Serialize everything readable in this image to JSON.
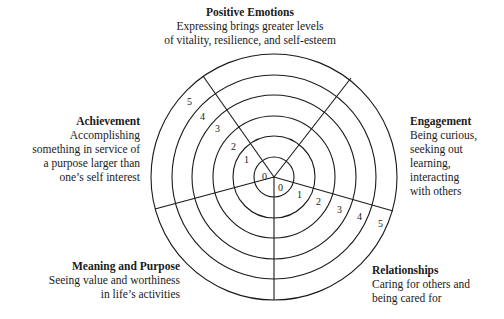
{
  "domains": [
    {
      "id": "positive-emotions",
      "title": "Positive Emotions",
      "description": "Expressing brings greater levels of vitality, resilience, and self-esteem",
      "lines": [
        "Expressing brings greater levels",
        "of vitality, resilience, and self-esteem"
      ]
    },
    {
      "id": "engagement",
      "title": "Engagement",
      "description": "Being curious, seeking out learning, interacting with others",
      "lines": [
        "Being curious,",
        "seeking out",
        "learning,",
        "interacting",
        "with others"
      ]
    },
    {
      "id": "relationships",
      "title": "Relationships",
      "description": "Caring for others and being cared for",
      "lines": [
        "Caring for others and",
        "being cared for"
      ]
    },
    {
      "id": "meaning-and-purpose",
      "title": "Meaning and Purpose",
      "description": "Seeing value and worthiness in life's activities",
      "lines": [
        "Seeing value and worthiness",
        "in life’s activities"
      ]
    },
    {
      "id": "achievement",
      "title": "Achievement",
      "description": "Accomplishing something in service of a purpose larger than one's self interest",
      "lines": [
        "Accomplishing",
        "something in service of",
        "a purpose larger than",
        "one’s self interest"
      ]
    }
  ],
  "scale": {
    "min": 0,
    "max": 5,
    "labels": [
      "0",
      "1",
      "2",
      "3",
      "4",
      "5"
    ]
  },
  "colors": {
    "line": "#1a1a1a",
    "background": "#ffffff"
  }
}
